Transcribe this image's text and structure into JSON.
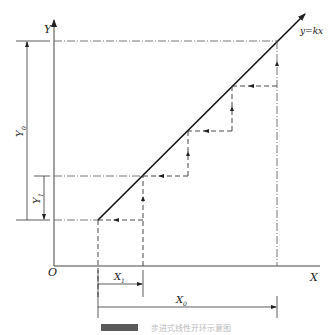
{
  "figure": {
    "labels": {
      "y_axis": "Y",
      "x_axis": "X",
      "origin": "O",
      "line": "y=kx",
      "y0": "Y",
      "y0_sub": "0",
      "y1": "Y",
      "y1_sub": "1",
      "x1": "X",
      "x1_sub": "1",
      "x0": "X",
      "x0_sub": "0"
    },
    "caption": {
      "text": "步进式线性开环示意图"
    },
    "colors": {
      "stroke": "#222222",
      "caption_box": "#555555"
    }
  }
}
